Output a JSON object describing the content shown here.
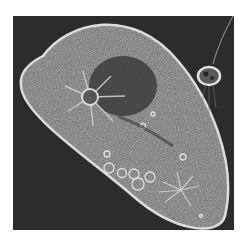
{
  "image": {
    "subject": "paramecium micrograph",
    "background_color": "#ffffff",
    "frame_color": "#2a2a2a",
    "cell_fill": "#6e6e6e",
    "cell_border": "#d8d8d8",
    "macronucleus_color": "#3a3a3a",
    "vacuole_color": "#e0e0e0",
    "features": [
      "cell-body",
      "cell-membrane",
      "macronucleus",
      "contractile-vacuole-anterior",
      "contractile-vacuole-posterior",
      "food-vacuoles",
      "small-organism-top-right"
    ]
  }
}
